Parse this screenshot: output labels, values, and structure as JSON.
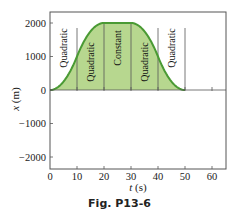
{
  "chart_data": {
    "type": "area",
    "title": "",
    "xlabel": "t (s)",
    "ylabel": "x (m)",
    "xlim": [
      0,
      65
    ],
    "ylim": [
      -2300,
      2300
    ],
    "x_ticks": [
      0,
      10,
      20,
      30,
      40,
      50,
      60
    ],
    "y_ticks": [
      2000,
      1000,
      0,
      -1000,
      -2000
    ],
    "x_tick_labels": [
      "0",
      "10",
      "20",
      "30",
      "40",
      "50",
      "60"
    ],
    "y_tick_labels": [
      "2000",
      "1000",
      "0",
      "−1000",
      "−2000"
    ],
    "grid": false,
    "series": [
      {
        "name": "x(t)",
        "x": [
          0,
          5,
          10,
          15,
          20,
          25,
          30,
          35,
          40,
          45,
          50,
          60,
          65
        ],
        "values": [
          0,
          250,
          1000,
          1750,
          2000,
          2000,
          2000,
          1750,
          1000,
          250,
          0,
          0,
          0
        ]
      }
    ],
    "segments": [
      {
        "label": "Quadratic",
        "t_start": 0,
        "t_end": 10
      },
      {
        "label": "Quadratic",
        "t_start": 10,
        "t_end": 20
      },
      {
        "label": "Constant",
        "t_start": 20,
        "t_end": 30
      },
      {
        "label": "Quadratic",
        "t_start": 30,
        "t_end": 40
      },
      {
        "label": "Quadratic",
        "t_start": 40,
        "t_end": 50
      }
    ],
    "colors": {
      "line": "#4a9a34",
      "fill": "#b7d78f"
    }
  },
  "axes": {
    "x_title": "t",
    "x_unit": " (s)",
    "y_title": "x",
    "y_unit": " (m)"
  },
  "caption": "Fig. P13-6"
}
